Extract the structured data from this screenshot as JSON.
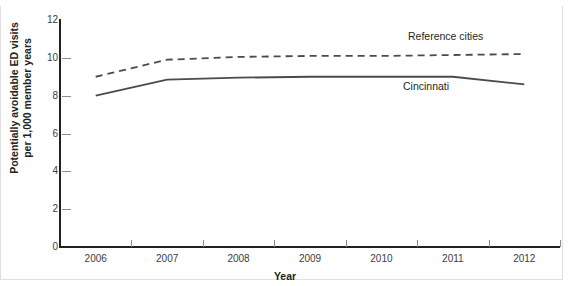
{
  "chart_data": {
    "type": "line",
    "title": "",
    "xlabel": "Year",
    "ylabel_line1": "Potentially avoidable ED visits",
    "ylabel_line2": "per 1,000 member years",
    "categories": [
      "2006",
      "2007",
      "2008",
      "2009",
      "2010",
      "2011",
      "2012"
    ],
    "x": [
      2006,
      2007,
      2008,
      2009,
      2010,
      2011,
      2012
    ],
    "ylim": [
      0,
      12
    ],
    "yticks": [
      0,
      2,
      4,
      6,
      8,
      10,
      12
    ],
    "ytick_labels": [
      "0",
      "2",
      "4",
      "6",
      "8",
      "10",
      "12"
    ],
    "grid": false,
    "legend_position": "inline-annotation",
    "series": [
      {
        "name": "Reference cities",
        "style": "dashed",
        "color": "#4a4a52",
        "values": [
          9.0,
          9.9,
          10.05,
          10.1,
          10.1,
          10.15,
          10.2
        ]
      },
      {
        "name": "Cincinnati",
        "style": "solid",
        "color": "#4a4a52",
        "values": [
          8.0,
          8.85,
          8.95,
          9.0,
          9.0,
          9.0,
          8.6
        ]
      }
    ],
    "annotations": [
      {
        "text": "Reference cities",
        "series": "Reference cities"
      },
      {
        "text": "Cincinnati",
        "series": "Cincinnati"
      }
    ]
  },
  "colors": {
    "axis": "#231f20",
    "tick": "#8d8d93",
    "line": "#4a4a52",
    "frame": "#dfdfe2",
    "background": "#ffffff"
  }
}
